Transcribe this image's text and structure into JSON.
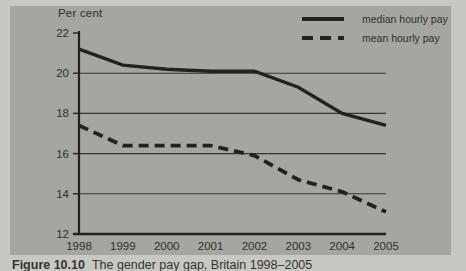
{
  "figure": {
    "caption_bold": "Figure 10.10",
    "caption_rest": "The gender pay gap, Britain 1998–2005",
    "colors": {
      "page_bg": "#c7c8c2",
      "panel_bg": "#a5a69f",
      "line": "#232220",
      "grid": "#35342f",
      "text": "#2f2e2a"
    }
  },
  "chart_data": {
    "type": "line",
    "title": "",
    "ylabel": "Per cent",
    "xlabel": "",
    "x": [
      "1998",
      "1999",
      "2000",
      "2001",
      "2002",
      "2003",
      "2004",
      "2005"
    ],
    "series": [
      {
        "name": "median hourly pay",
        "line_style": "solid",
        "values": [
          21.2,
          20.4,
          20.2,
          20.1,
          20.1,
          19.3,
          18.0,
          17.4
        ]
      },
      {
        "name": "mean hourly pay",
        "line_style": "dashed",
        "values": [
          17.4,
          16.4,
          16.4,
          16.4,
          15.9,
          14.7,
          14.1,
          13.1
        ]
      }
    ],
    "ylim": [
      12,
      22
    ],
    "yticks": [
      12,
      14,
      16,
      18,
      20,
      22
    ],
    "gridlines": [
      14,
      16,
      18,
      20
    ],
    "grid": true,
    "legend_position": "top-right"
  }
}
